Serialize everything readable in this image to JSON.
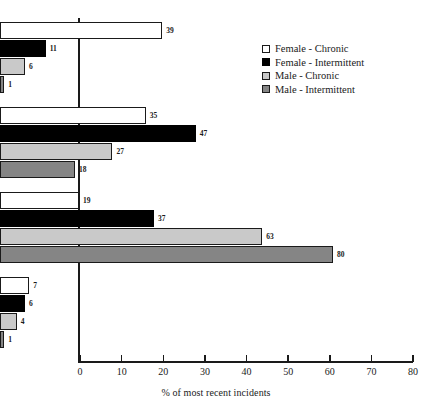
{
  "chart_data": {
    "type": "bar",
    "orientation": "horizontal",
    "title": "",
    "xlabel": "% of most recent incidents",
    "ylabel": "",
    "xlim": [
      0,
      80
    ],
    "xticks": [
      0,
      10,
      20,
      30,
      40,
      50,
      60,
      70,
      80
    ],
    "grid": false,
    "legend_position": "top-right-inside",
    "categories": [
      "A crime",
      "Wrong but not a crime",
      "Just something that happens",
      "Unsure"
    ],
    "category_lines": [
      [
        "A crime"
      ],
      [
        "Wrong but",
        "not a crime"
      ],
      [
        "Just",
        "something",
        "that happens"
      ],
      [
        "Unsure"
      ]
    ],
    "series": [
      {
        "name": "Female - Chronic",
        "color": "#ffffff",
        "values": [
          39,
          35,
          19,
          7
        ]
      },
      {
        "name": "Female - Intermittent",
        "color": "#000000",
        "values": [
          11,
          47,
          37,
          6
        ]
      },
      {
        "name": "Male - Chronic",
        "color": "#c9c9c9",
        "values": [
          6,
          27,
          63,
          4
        ]
      },
      {
        "name": "Male - Intermittent",
        "color": "#858585",
        "values": [
          18,
          18,
          80,
          1
        ]
      }
    ],
    "values_by_group": [
      [
        39,
        11,
        6,
        1
      ],
      [
        35,
        47,
        27,
        18
      ],
      [
        19,
        37,
        63,
        80
      ],
      [
        7,
        6,
        4,
        1
      ]
    ]
  },
  "axis": {
    "tick_labels": [
      "0",
      "10",
      "20",
      "30",
      "40",
      "50",
      "60",
      "70",
      "80"
    ],
    "title": "% of most recent incidents"
  },
  "legend": {
    "items": [
      {
        "label": "Female - Chronic"
      },
      {
        "label": "Female - Intermittent"
      },
      {
        "label": "Male - Chronic"
      },
      {
        "label": "Male - Intermittent"
      }
    ]
  }
}
